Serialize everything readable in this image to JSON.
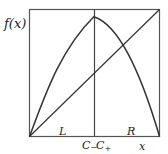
{
  "diagram": {
    "type": "piecewise-map",
    "y_axis_label": "f(x)",
    "x_axis_label": "x",
    "region_labels": {
      "left": "L",
      "right": "R"
    },
    "split_labels": {
      "minus": "C_",
      "plus": "C+"
    },
    "split_labels_display": {
      "minus_base": "C",
      "minus_sub": "−",
      "plus_base": "C",
      "plus_sub": "+"
    },
    "colors": {
      "stroke": "#333333",
      "frame": "#555555",
      "background": "#ffffff"
    },
    "elements": [
      {
        "name": "frame",
        "description": "unit square bounding box"
      },
      {
        "name": "diagonal",
        "description": "identity line y = x"
      },
      {
        "name": "left-branch",
        "description": "concave increasing curve from origin to top at split"
      },
      {
        "name": "right-branch",
        "description": "decreasing curve from near top at split to bottom-right corner"
      },
      {
        "name": "split-line",
        "description": "vertical line at critical point C"
      }
    ]
  }
}
